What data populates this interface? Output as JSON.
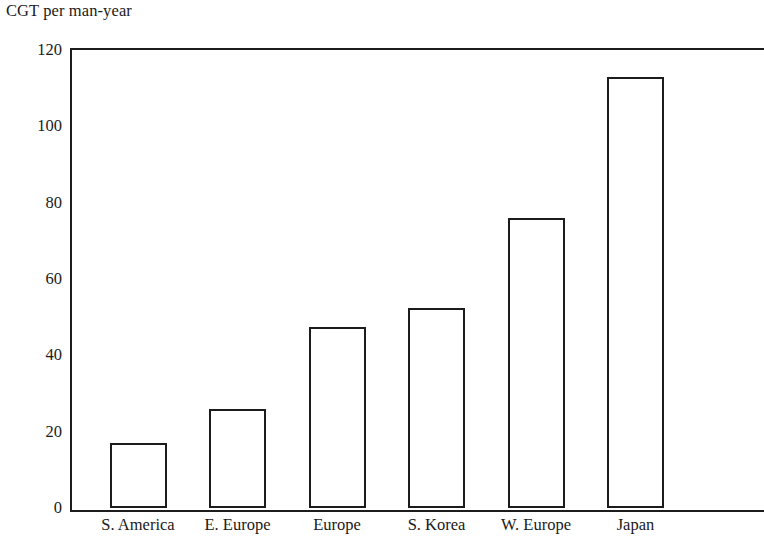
{
  "chart_data": {
    "type": "bar",
    "title": "CGT per man-year",
    "xlabel": "",
    "ylabel": "",
    "categories": [
      "S. America",
      "E. Europe",
      "Europe",
      "S. Korea",
      "W. Europe",
      "Japan"
    ],
    "values": [
      17,
      26,
      47.5,
      52.5,
      76,
      113
    ],
    "ylim": [
      0,
      120
    ],
    "yticks": [
      0,
      20,
      40,
      60,
      80,
      100,
      120
    ],
    "ytick_labels": [
      "0",
      "20",
      "40",
      "60",
      "80",
      "100",
      "120"
    ],
    "grid": false,
    "legend": null,
    "bar_style": {
      "fill": "#ffffff",
      "edge_color": "#1c1c1c",
      "edge_width_px": 2
    },
    "axis_color": "#1c1c1c",
    "background": "#ffffff"
  }
}
